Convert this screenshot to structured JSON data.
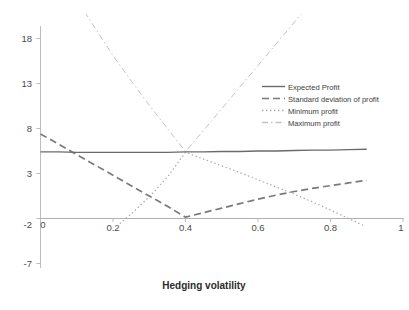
{
  "chart_data": {
    "type": "line",
    "title": "",
    "subtitle": "",
    "xlabel": "Hedging volatility",
    "ylabel": "",
    "xlim": [
      0,
      1
    ],
    "ylim": [
      -7,
      20.5
    ],
    "xticks": [
      "0",
      "0.2",
      "0.4",
      "0.6",
      "0.8",
      "1"
    ],
    "xtick_values": [
      0,
      0.2,
      0.4,
      0.6,
      0.8,
      1
    ],
    "yticks": [
      "-7",
      "-2",
      "3",
      "8",
      "13",
      "18"
    ],
    "ytick_values": [
      -7,
      -2,
      3,
      8,
      13,
      18
    ],
    "grid": false,
    "legend_position": "upper right",
    "zero_line": 0,
    "x": [
      0,
      0.05,
      0.1,
      0.15,
      0.2,
      0.25,
      0.3,
      0.35,
      0.4,
      0.45,
      0.5,
      0.55,
      0.6,
      0.65,
      0.7,
      0.75,
      0.8,
      0.85,
      0.9
    ],
    "series": [
      {
        "name": "Expected Profit",
        "style": "solid",
        "color": "#6b6b6b",
        "values": [
          7.4,
          7.4,
          7.35,
          7.35,
          7.35,
          7.35,
          7.35,
          7.35,
          7.4,
          7.4,
          7.45,
          7.45,
          7.5,
          7.5,
          7.55,
          7.6,
          7.6,
          7.65,
          7.7
        ]
      },
      {
        "name": "Standard deviation of profit",
        "style": "dashed",
        "color": "#7a7a7a",
        "values": [
          9.4,
          8.25,
          7.1,
          5.95,
          4.8,
          3.65,
          2.5,
          1.35,
          0.15,
          0.65,
          1.15,
          1.65,
          2.15,
          2.6,
          3.0,
          3.35,
          3.65,
          3.95,
          4.25
        ]
      },
      {
        "name": "Minimum profit",
        "style": "dotted",
        "color": "#a8a8a8",
        "values": [
          -4.2,
          -4.1,
          -3.6,
          -2.6,
          -1.2,
          0.5,
          2.4,
          4.6,
          7.35,
          6.6,
          5.85,
          5.1,
          4.3,
          3.5,
          2.7,
          1.85,
          0.95,
          0.0,
          -0.95
        ]
      },
      {
        "name": "Maximum profit",
        "style": "dashdot",
        "color": "#c2c2c2",
        "values": [
          30.5,
          27.4,
          24.3,
          21.2,
          18.1,
          15.3,
          12.6,
          10.0,
          7.45,
          9.8,
          12.2,
          14.6,
          17.0,
          19.4,
          21.8,
          24.2,
          26.6,
          29.0,
          31.4
        ]
      }
    ],
    "legend_entries": [
      {
        "label": "Expected Profit",
        "style": "solid",
        "color": "#6b6b6b"
      },
      {
        "label": "Standard deviation of profit",
        "style": "dashed",
        "color": "#7a7a7a"
      },
      {
        "label": "Minimum profit",
        "style": "dotted",
        "color": "#a8a8a8"
      },
      {
        "label": "Maximum profit",
        "style": "dashdot",
        "color": "#c2c2c2"
      }
    ]
  },
  "axis": {
    "x_title": "Hedging volatility",
    "x_tick_0": "0",
    "x_tick_1": "0.2",
    "x_tick_2": "0.4",
    "x_tick_3": "0.6",
    "x_tick_4": "0.8",
    "x_tick_5": "1",
    "y_tick_0": "18",
    "y_tick_1": "13",
    "y_tick_2": "8",
    "y_tick_3": "3",
    "y_tick_4": "-2",
    "y_tick_5": "-7"
  },
  "legend": {
    "item_0": "Expected Profit",
    "item_1": "Standard deviation of profit",
    "item_2": "Minimum profit",
    "item_3": "Maximum profit"
  },
  "colors": {
    "axis_line": "#b9b9b9",
    "zero_line": "#b0b0b0",
    "expected_profit": "#6b6b6b",
    "std_dev": "#7a7a7a",
    "min_profit": "#a8a8a8",
    "max_profit": "#c2c2c2",
    "text": "#3d3d3d",
    "background": "#ffffff"
  }
}
